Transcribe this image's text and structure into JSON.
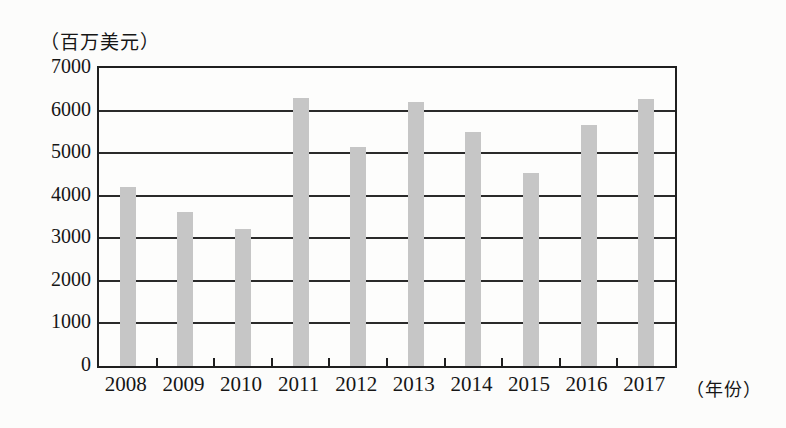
{
  "figure": {
    "unit_label": "（百万美元）",
    "year_axis_label": "（年份）"
  },
  "chart_data": {
    "type": "bar",
    "title": "",
    "categories": [
      "2008",
      "2009",
      "2010",
      "2011",
      "2012",
      "2013",
      "2014",
      "2015",
      "2016",
      "2017"
    ],
    "values": [
      4200,
      3620,
      3230,
      6300,
      5150,
      6200,
      5500,
      4530,
      5650,
      6280
    ],
    "ylabel": "（百万美元）",
    "xlabel": "（年份）",
    "ylim": [
      0,
      7000
    ],
    "yticks": [
      0,
      1000,
      2000,
      3000,
      4000,
      5000,
      6000,
      7000
    ],
    "ytick_interval": 1000,
    "grid": true,
    "legend": "none",
    "bar_color": "#c6c6c6",
    "line_color": "#1f1f1f",
    "background_color": "#fcfcfb"
  }
}
